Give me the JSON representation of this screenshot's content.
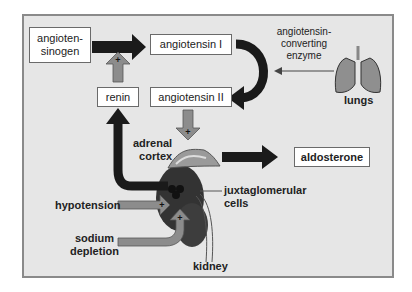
{
  "diagram": {
    "nodes": {
      "angiotensinogen": "angioten-\nsinogen",
      "angiotensinogen_line1": "angioten-",
      "angiotensinogen_line2": "sinogen",
      "angiotensin_1": "angiotensin I",
      "angiotensin_2": "angiotensin II",
      "renin": "renin",
      "aldosterone": "aldosterone"
    },
    "labels": {
      "ace_line1": "angiotensin-",
      "ace_line2": "converting",
      "ace_line3": "enzyme",
      "lungs": "lungs",
      "adrenal_line1": "adrenal",
      "adrenal_line2": "cortex",
      "jg_line1": "juxtaglomerular",
      "jg_line2": "cells",
      "hypotension": "hypotension",
      "sodium_line1": "sodium",
      "sodium_line2": "depletion",
      "kidney": "kidney",
      "plus": "+"
    },
    "colors": {
      "background": "#e6e6e6",
      "frame": "#8a8a8a",
      "dark_arrow": "#1a1a1a",
      "stimulus_arrow": "#8c8c8c",
      "kidney": "#3a3a3a"
    }
  }
}
